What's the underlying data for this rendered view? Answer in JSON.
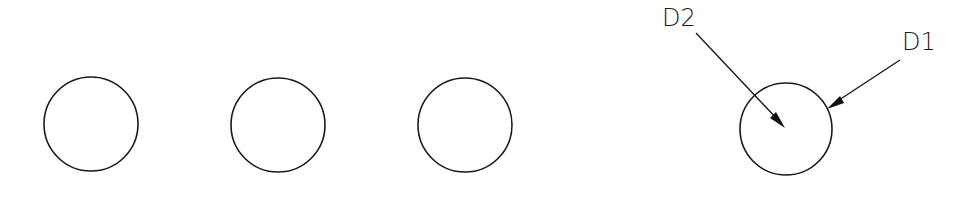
{
  "drawing": {
    "circles": [
      {
        "id": "circle-1",
        "cx": 91,
        "cy": 124,
        "r": 47
      },
      {
        "id": "circle-2",
        "cx": 278,
        "cy": 125,
        "r": 47
      },
      {
        "id": "circle-3",
        "cx": 465,
        "cy": 125,
        "r": 47
      },
      {
        "id": "circle-4",
        "cx": 786,
        "cy": 129,
        "r": 46
      }
    ],
    "callouts": [
      {
        "label": "D2",
        "text_x": 662,
        "text_y": 27,
        "from": [
          696,
          33
        ],
        "to": [
          785,
          128
        ]
      },
      {
        "label": "D1",
        "text_x": 902,
        "text_y": 50,
        "from": [
          900,
          60
        ],
        "to": [
          827,
          108
        ]
      }
    ],
    "colors": {
      "line": "#1a1a1a",
      "background": "#ffffff"
    }
  }
}
